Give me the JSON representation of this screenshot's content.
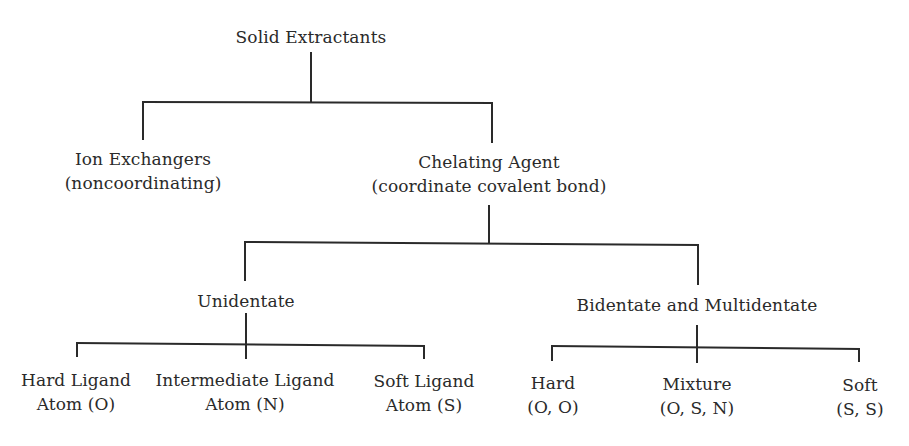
{
  "diagram": {
    "root": {
      "label": "Solid Extractants"
    },
    "level1": [
      {
        "line1": "Ion Exchangers",
        "line2": "(noncoordinating)"
      },
      {
        "line1": "Chelating Agent",
        "line2": "(coordinate covalent bond)"
      }
    ],
    "level2": [
      {
        "label": "Unidentate"
      },
      {
        "label": "Bidentate and Multidentate"
      }
    ],
    "unidentate_children": [
      {
        "line1": "Hard Ligand",
        "line2": "Atom (O)"
      },
      {
        "line1": "Intermediate Ligand",
        "line2": "Atom (N)"
      },
      {
        "line1": "Soft Ligand",
        "line2": "Atom (S)"
      }
    ],
    "multidentate_children": [
      {
        "line1": "Hard",
        "line2": "(O, O)"
      },
      {
        "line1": "Mixture",
        "line2": "(O, S, N)"
      },
      {
        "line1": "Soft",
        "line2": "(S, S)"
      }
    ]
  }
}
